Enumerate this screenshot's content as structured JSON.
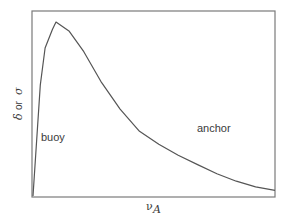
{
  "chart_data": {
    "type": "line",
    "title": "",
    "xlabel": "ν_A",
    "ylabel": "δ or σ",
    "x_label_parts": {
      "symbol": "ν",
      "subscript": "A"
    },
    "y_label_parts": {
      "delta": "δ",
      "or": "or",
      "sigma": "σ"
    },
    "grid": false,
    "ticks": false,
    "legend": null,
    "annotations": [
      {
        "text": "buoy",
        "near": "rising-edge"
      },
      {
        "text": "anchor",
        "near": "decaying-tail"
      }
    ],
    "xlim": [
      0,
      1
    ],
    "ylim": [
      0,
      1
    ],
    "series": [
      {
        "name": "δ or σ vs ν_A",
        "x": [
          0.0,
          0.03,
          0.05,
          0.08,
          0.095,
          0.15,
          0.21,
          0.28,
          0.36,
          0.44,
          0.52,
          0.6,
          0.68,
          0.76,
          0.84,
          0.92,
          1.0
        ],
        "y": [
          0.0,
          0.6,
          0.8,
          0.9,
          0.94,
          0.89,
          0.78,
          0.62,
          0.47,
          0.35,
          0.28,
          0.22,
          0.17,
          0.12,
          0.08,
          0.05,
          0.03
        ],
        "color": "#555555"
      }
    ]
  },
  "labels": {
    "buoy": "buoy",
    "anchor": "anchor",
    "x_symbol": "ν",
    "x_subscript": "A",
    "y_delta": "δ",
    "y_or": "or",
    "y_sigma": "σ"
  },
  "colors": {
    "frame": "#7a7a7a",
    "curve": "#555555",
    "text": "#3a3a3a",
    "background": "#ffffff"
  }
}
